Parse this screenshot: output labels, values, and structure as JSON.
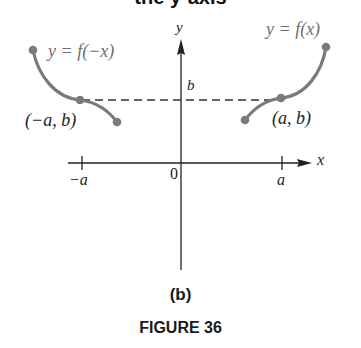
{
  "header": {
    "cut_title": "the y-axis"
  },
  "diagram": {
    "axes": {
      "x_label": "x",
      "y_label": "y",
      "origin_label": "0",
      "x_ticks": [
        {
          "label": "−a"
        },
        {
          "label": "a"
        }
      ],
      "y_marker_label": "b"
    },
    "curves": [
      {
        "name": "reflected",
        "label": "y = f(−x)",
        "point_label": "(−a, b)"
      },
      {
        "name": "original",
        "label": "y = f(x)",
        "point_label": "(a, b)"
      }
    ],
    "colors": {
      "curve": "#7a7a7a",
      "axis": "#222222",
      "dashed": "#333333"
    }
  },
  "captions": {
    "sub": "(b)",
    "figure": "FIGURE 36"
  }
}
